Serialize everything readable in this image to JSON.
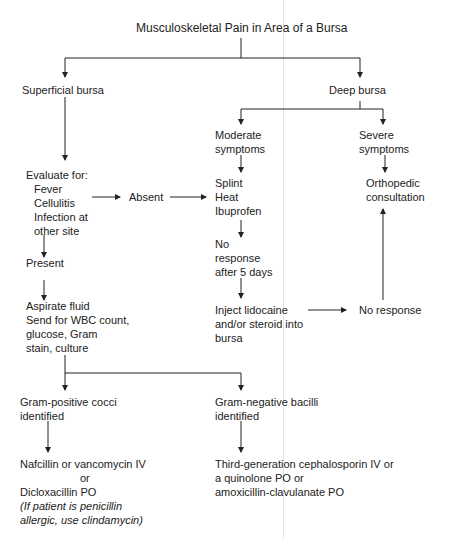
{
  "title": "Musculoskeletal Pain in Area of a Bursa",
  "nodes": {
    "superficial": "Superficial bursa",
    "deep": "Deep bursa",
    "moderate": "Moderate\nsymptoms",
    "severe": "Severe\nsymptoms",
    "evaluate_heading": "Evaluate for:",
    "evaluate_items": "Fever\nCellulitis\nInfection at\nother site",
    "absent": "Absent",
    "conservative": "Splint\nHeat\nIbuprofen",
    "ortho": "Orthopedic\nconsultation",
    "no_response_5d": "No\nresponse\nafter 5 days",
    "present": "Present",
    "inject": "Inject lidocaine\nand/or steroid into\nbursa",
    "no_response": "No response",
    "aspirate": "Aspirate fluid\nSend for WBC count,\nglucose, Gram\nstain, culture",
    "gram_pos": "Gram-positive cocci\nidentified",
    "gram_neg": "Gram-negative bacilli\nidentified",
    "gram_pos_tx_1": "Nafcillin or vancomycin IV",
    "gram_pos_tx_or": "or",
    "gram_pos_tx_2": "Dicloxacillin PO",
    "gram_pos_note": "(If patient is penicillin\nallergic, use clindamycin)",
    "gram_neg_tx": "Third-generation cephalosporin IV or\na quinolone PO or\namoxicillin-clavulanate PO"
  },
  "colors": {
    "line": "#222222",
    "text": "#222222",
    "fold": "#e4e4e4"
  }
}
